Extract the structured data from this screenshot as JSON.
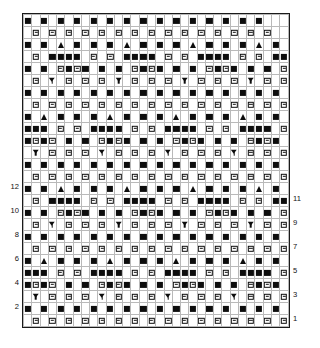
{
  "chart": {
    "type": "symbol-grid",
    "columns": 32,
    "rows": 26,
    "cell_width_px": 8.28,
    "cell_height_px": 12.0,
    "grid_origin": {
      "x": 22,
      "y": 13
    },
    "background_color": "#ffffff",
    "symbol_color": "#0d0d0d",
    "minor_gridline_color": "#b9b9b9",
    "major_gridline_color": "#3a3a3a",
    "border_color": "#1a1a1a",
    "column_repeat": 8,
    "row_repeat": 4,
    "legend": {
      "solid": "solid-square",
      "bar": "boxed-bar-square",
      "tri": "up-triangle",
      "chev": "down-chevron",
      "empty": "blank-cell"
    }
  },
  "axes": {
    "left_labels": [
      {
        "row": 2,
        "label": "2"
      },
      {
        "row": 4,
        "label": "4"
      },
      {
        "row": 6,
        "label": "6"
      },
      {
        "row": 8,
        "label": "8"
      },
      {
        "row": 10,
        "label": "10"
      },
      {
        "row": 12,
        "label": "12"
      }
    ],
    "right_labels": [
      {
        "row": 1,
        "label": "1"
      },
      {
        "row": 3,
        "label": "3"
      },
      {
        "row": 5,
        "label": "5"
      },
      {
        "row": 7,
        "label": "7"
      },
      {
        "row": 9,
        "label": "9"
      },
      {
        "row": 11,
        "label": "11"
      }
    ]
  },
  "chart_data": {
    "type": "heatmap",
    "xlabel": "",
    "ylabel": "",
    "categories": [
      1,
      2,
      3,
      4,
      5,
      6,
      7,
      8,
      9,
      10,
      11,
      12,
      13,
      14,
      15,
      16,
      17,
      18,
      19,
      20,
      21,
      22,
      23,
      24,
      25,
      26,
      27,
      28,
      29,
      30,
      31,
      32
    ],
    "legend_position": "none",
    "grid": true,
    "symbol_key": {
      "s": "solid-square",
      "b": "boxed-bar-square",
      "t": "up-triangle",
      "v": "down-chevron",
      ".": "blank"
    },
    "rows_top_to_bottom": [
      "s.s.s.s.s.s.s.s.s.s.s.s.s.s.s.",
      ".b.b.b.b.b.b.b.b.b.b.b.b.b.b.b.",
      "s.s.t.s.s.s.t.s.s.s.t.s.s.s.t.s",
      ".b.ssss.b.b.ssss.b.b.ssss.b.b.ss",
      "s.s.bsbs.s.s.bsbs.s.s.bsbs.s.s.b",
      ".b.v.b.b.b.v.b.b.b.v.b.b.b.v.b.b",
      "s.s.s.s.s.s.s.s.s.s.s.s.s.s.s.s.",
      ".b.b.b.b.b.b.b.b.b.b.b.b.b.b.b.b",
      "s.t.s.s.s.t.s.s.s.t.s.s.s.t.s.s.",
      "sss.b.b.ssss.b.b.ssss.b.b.ssss.b",
      "sbsb.s.s.bsbs.s.s.bsbs.s.s.bsbs.",
      ".v.b.b.b.v.b.b.b.v.b.b.b.v.b.b.b",
      "s.s.s.s.s.s.s.s.s.s.s.s.s.s.s.s.",
      ".b.b.b.b.b.b.b.b.b.b.b.b.b.b.b.b",
      "s.s.t.s.s.s.t.s.s.s.t.s.s.s.t.s.",
      ".b.ssss.b.b.ssss.b.b.ssss.b.b.ss",
      "s.s.bsbs.s.s.bsbs.s.s.bsbs.s.s.b",
      ".b.v.b.b.b.v.b.b.b.v.b.b.b.v.b.b",
      "s.s.s.s.s.s.s.s.s.s.s.s.s.s.s.s.",
      ".b.b.b.b.b.b.b.b.b.b.b.b.b.b.b.b",
      "s.t.s.s.s.t.s.s.s.t.s.s.s.t.s.s.",
      "sss.b.b.ssss.b.b.ssss.b.b.ssss.b",
      "sbsb.s.s.bsbs.s.s.bsbs.s.s.bsbs.",
      ".v.b.b.b.v.b.b.b.v.b.b.b.v.b.b.b",
      "s.s.s.s.s.s.s.s.s.s.s.s.s.s.s.s.",
      ".b.b.b.b.b.b.b.b.b.b.b.b.b.b.b.b"
    ]
  }
}
